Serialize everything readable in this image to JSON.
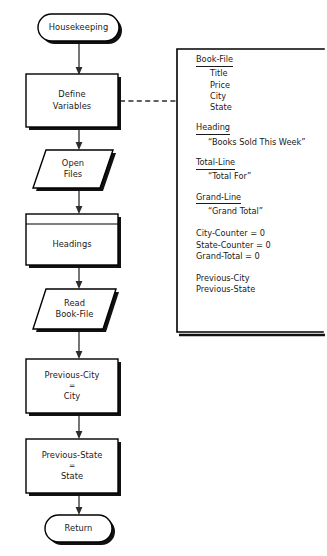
{
  "diagram": {
    "colors": {
      "stroke": "#000000",
      "fill": "#ffffff",
      "shadow": "#111111",
      "connector": "#2c2c2c",
      "text": "#1a1a1a"
    }
  },
  "nodes": {
    "start": {
      "label": "Housekeeping",
      "shape": "terminator"
    },
    "define_variables": {
      "line1": "Define",
      "line2": "Variables",
      "shape": "process"
    },
    "open_files": {
      "line1": "Open",
      "line2": "Files",
      "shape": "input-output"
    },
    "headings": {
      "label": "Headings",
      "shape": "predefined-process"
    },
    "read_book_file": {
      "line1": "Read",
      "line2": "Book-File",
      "shape": "input-output"
    },
    "previous_city": {
      "line1": "Previous-City",
      "line2": "=",
      "line3": "City",
      "shape": "process"
    },
    "previous_state": {
      "line1": "Previous-State",
      "line2": "=",
      "line3": "State",
      "shape": "process"
    },
    "end": {
      "label": "Return",
      "shape": "terminator"
    }
  },
  "annotation": {
    "book_file": {
      "heading": "Book-File",
      "items": [
        "Title",
        "Price",
        "City",
        "State"
      ]
    },
    "heading_group": {
      "heading": "Heading",
      "value": "“Books Sold This Week”"
    },
    "total_line": {
      "heading": "Total-Line",
      "value": "“Total For”"
    },
    "grand_line": {
      "heading": "Grand-Line",
      "value": "“Grand Total”"
    },
    "counters": [
      "City-Counter = 0",
      "State-Counter = 0",
      "Grand-Total = 0"
    ],
    "previous_vars": [
      "Previous-City",
      "Previous-State"
    ]
  }
}
